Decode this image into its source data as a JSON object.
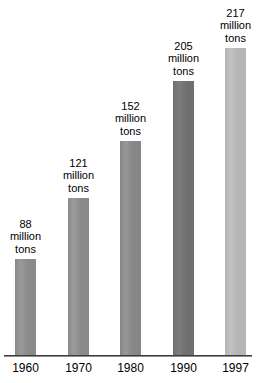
{
  "chart_data": {
    "type": "bar",
    "title": "",
    "subtitle": "",
    "xlabel": "",
    "ylabel": "",
    "unit": "million tons",
    "categories": [
      "1960",
      "1970",
      "1980",
      "1990",
      "1997"
    ],
    "values": [
      88,
      121,
      152,
      205,
      217
    ],
    "ylim": [
      0,
      217
    ],
    "grid": false,
    "legend": null,
    "data_labels": [
      "88 million tons",
      "121 million tons",
      "152 million tons",
      "205 million tons",
      "217 million tons"
    ],
    "bars": [
      {
        "category": "1960",
        "value": 88,
        "label_lines": [
          "88",
          "million",
          "tons"
        ],
        "color": "#8a8a8a",
        "color_light": "#9a9a9a",
        "left_px": 15,
        "width_px": 21,
        "top_px": 258
      },
      {
        "category": "1970",
        "value": 121,
        "label_lines": [
          "121",
          "million",
          "tons"
        ],
        "color": "#8a8a8a",
        "color_light": "#9c9c9c",
        "left_px": 68,
        "width_px": 21,
        "top_px": 197
      },
      {
        "category": "1980",
        "value": 152,
        "label_lines": [
          "152",
          "million",
          "tons"
        ],
        "color": "#868686",
        "color_light": "#979797",
        "left_px": 120,
        "width_px": 21,
        "top_px": 140
      },
      {
        "category": "1990",
        "value": 205,
        "label_lines": [
          "205",
          "million",
          "tons"
        ],
        "color": "#6f6f6f",
        "color_light": "#7d7d7d",
        "left_px": 173,
        "width_px": 21,
        "top_px": 80
      },
      {
        "category": "1997",
        "value": 217,
        "label_lines": [
          "217",
          "million",
          "tons"
        ],
        "color": "#b5b5b5",
        "color_light": "#c2c2c2",
        "left_px": 225,
        "width_px": 21,
        "top_px": 47
      }
    ],
    "axis": {
      "baseline_y_px": 355,
      "line_color": "#8c8c8c",
      "edge_color": "#3d3d3d"
    }
  }
}
